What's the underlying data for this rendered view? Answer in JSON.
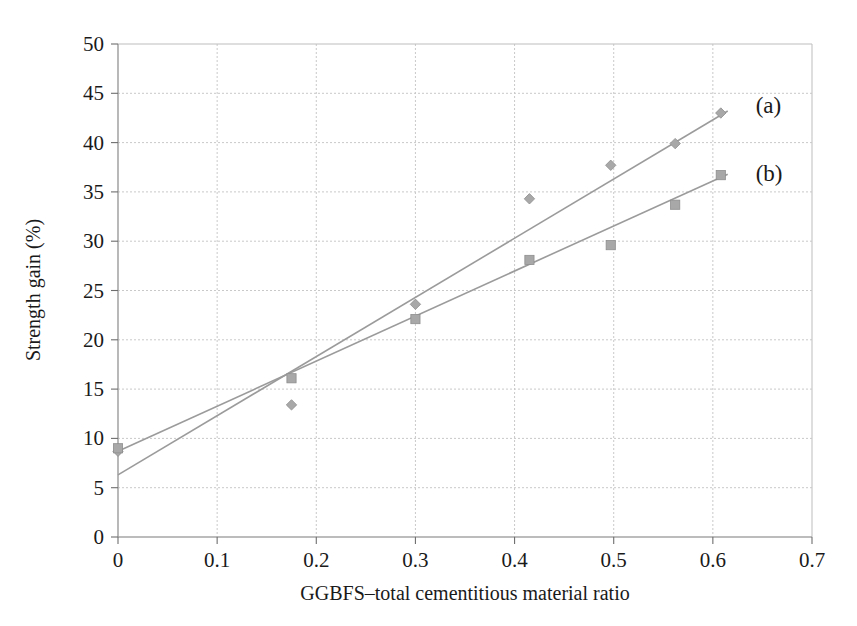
{
  "chart_data": {
    "type": "scatter",
    "title": "",
    "xlabel": "GGBFS–total cementitious material ratio",
    "ylabel": "Strength gain (%)",
    "xlim": [
      0,
      0.7
    ],
    "ylim": [
      0,
      50
    ],
    "xticks": [
      "0",
      "0.1",
      "0.2",
      "0.3",
      "0.4",
      "0.5",
      "0.6",
      "0.7"
    ],
    "xtick_values": [
      0,
      0.1,
      0.2,
      0.3,
      0.4,
      0.5,
      0.6,
      0.7
    ],
    "yticks": [
      "0",
      "5",
      "10",
      "15",
      "20",
      "25",
      "30",
      "35",
      "40",
      "45",
      "50"
    ],
    "ytick_values": [
      0,
      5,
      10,
      15,
      20,
      25,
      30,
      35,
      40,
      45,
      50
    ],
    "grid": true,
    "legend_position": "inline-right",
    "series": [
      {
        "name": "(a)",
        "marker": "diamond",
        "color": "#a8a8a8",
        "label_x": 0.625,
        "label_y": 43.8,
        "points": [
          {
            "x": 0.0,
            "y": 8.7
          },
          {
            "x": 0.175,
            "y": 13.4
          },
          {
            "x": 0.3,
            "y": 23.6
          },
          {
            "x": 0.415,
            "y": 34.3
          },
          {
            "x": 0.497,
            "y": 37.7
          },
          {
            "x": 0.562,
            "y": 39.9
          },
          {
            "x": 0.608,
            "y": 43.0
          }
        ],
        "trendline": {
          "x0": 0.0,
          "y0": 6.3,
          "x1": 0.615,
          "y1": 43.2
        }
      },
      {
        "name": "(b)",
        "marker": "square",
        "color": "#a8a8a8",
        "label_x": 0.625,
        "label_y": 36.9,
        "points": [
          {
            "x": 0.0,
            "y": 9.0
          },
          {
            "x": 0.175,
            "y": 16.1
          },
          {
            "x": 0.3,
            "y": 22.1
          },
          {
            "x": 0.415,
            "y": 28.1
          },
          {
            "x": 0.497,
            "y": 29.6
          },
          {
            "x": 0.562,
            "y": 33.7
          },
          {
            "x": 0.608,
            "y": 36.7
          }
        ],
        "trendline": {
          "x0": 0.0,
          "y0": 8.7,
          "x1": 0.615,
          "y1": 36.8
        }
      }
    ]
  }
}
